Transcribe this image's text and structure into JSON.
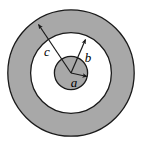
{
  "figure": {
    "name": "concentric-circles-cross-section",
    "width": 142,
    "height": 148,
    "background_color": "#ffffff",
    "center": {
      "x": 71,
      "y": 73
    },
    "colors": {
      "shaded_fill": "#a8a8a8",
      "clear_fill": "#ffffff",
      "stroke": "#1a1a1a",
      "page_background": "#ffffff"
    },
    "regions": [
      {
        "id": "outer-shaded-annulus",
        "label": "outer shaded ring",
        "inner_radius": 41,
        "outer_radius": 64,
        "fill": "#a8a8a8"
      },
      {
        "id": "middle-clear-annulus",
        "label": "middle clear ring",
        "inner_radius": 17,
        "outer_radius": 41,
        "fill": "#ffffff"
      },
      {
        "id": "inner-shaded-disk",
        "label": "inner shaded disk",
        "inner_radius": 0,
        "outer_radius": 17,
        "fill": "#a8a8a8"
      }
    ],
    "radii": [
      {
        "id": "radius-a",
        "label": "a",
        "length": 17,
        "angle_deg": 3,
        "label_x": 74,
        "label_y": 86,
        "label_size": 13
      },
      {
        "id": "radius-b",
        "label": "b",
        "length": 41,
        "angle_deg": 53,
        "label_x": 88,
        "label_y": 62,
        "label_size": 13
      },
      {
        "id": "radius-c",
        "label": "c",
        "length": 64,
        "angle_deg": 131,
        "label_x": 47,
        "label_y": 56,
        "label_size": 13
      }
    ]
  }
}
